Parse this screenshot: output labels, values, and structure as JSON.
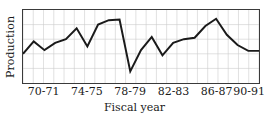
{
  "chart_data": {
    "type": "line",
    "title": "",
    "xlabel": "Fiscal year",
    "ylabel": "Production",
    "grid": true,
    "grid_vertical_count": 23,
    "grid_horizontal_count": 4,
    "legend": "none",
    "axis_tick_labels_y": [],
    "xlim": [
      0,
      22
    ],
    "ylim": [
      0,
      100
    ],
    "x_tick_labels": [
      "70-71",
      "74-75",
      "78-79",
      "82-83",
      "86-87",
      "90-91"
    ],
    "x_tick_positions": [
      2,
      6,
      10,
      14,
      18,
      21
    ],
    "categories": [
      "69-70",
      "70-71",
      "71-72",
      "72-73",
      "73-74",
      "74-75",
      "75-76",
      "76-77",
      "77-78",
      "78-79",
      "79-80",
      "80-81",
      "81-82",
      "82-83",
      "83-84",
      "84-85",
      "85-86",
      "86-87",
      "87-88",
      "88-89",
      "89-90",
      "90-91",
      "91-92"
    ],
    "x": [
      0,
      1,
      2,
      3,
      4,
      5,
      6,
      7,
      8,
      9,
      10,
      11,
      12,
      13,
      14,
      15,
      16,
      17,
      18,
      19,
      20,
      21,
      22
    ],
    "values": [
      40,
      57,
      45,
      55,
      60,
      75,
      50,
      80,
      86,
      87,
      16,
      45,
      63,
      38,
      55,
      60,
      62,
      78,
      88,
      66,
      52,
      44,
      44
    ],
    "series": [
      {
        "name": "Production",
        "color": "#1a1a1a",
        "line_width": 2,
        "values": [
          40,
          57,
          45,
          55,
          60,
          75,
          50,
          80,
          86,
          87,
          16,
          45,
          63,
          38,
          55,
          60,
          62,
          78,
          88,
          66,
          52,
          44,
          44
        ]
      }
    ],
    "annotations": [
      {
        "label": "sharp minimum",
        "x": 10,
        "y": 16
      },
      {
        "label": "global maximum",
        "x": 18,
        "y": 88
      }
    ]
  },
  "figure": {
    "background_color": "#ffffff",
    "frame_color": "#3a3a3a",
    "grid_color": "#cccccc",
    "line_color": "#1a1a1a"
  }
}
